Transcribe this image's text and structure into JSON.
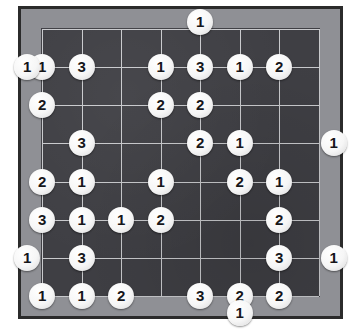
{
  "app": {
    "title": "Numbered Go Board Puzzle",
    "board_type": "go-board"
  },
  "colors": {
    "page_background": "#ffffff",
    "outer_border": "#2b2b2b",
    "frame": "#8f9095",
    "surface": "#3f3f44",
    "grid_line": "#c9cacd",
    "stone_fill": "#f6f6f6",
    "stone_text": "#16161a"
  },
  "board": {
    "columns": 8,
    "rows": 8,
    "grid": {
      "left": 20,
      "top": 19,
      "cell_width": 39.5,
      "cell_height": 38.2
    }
  },
  "stones": [
    {
      "label": "1",
      "col": 4,
      "row": -0.18,
      "placement": "top-edge",
      "name": "stone-top-c4"
    },
    {
      "label": "1",
      "col": -0.38,
      "row": 1,
      "placement": "left-edge",
      "name": "stone-r1-left"
    },
    {
      "label": "1",
      "col": 0,
      "row": 1,
      "placement": "on-board",
      "name": "stone-r1-c0"
    },
    {
      "label": "3",
      "col": 1,
      "row": 1,
      "placement": "on-board",
      "name": "stone-r1-c1"
    },
    {
      "label": "1",
      "col": 3,
      "row": 1,
      "placement": "on-board",
      "name": "stone-r1-c3"
    },
    {
      "label": "3",
      "col": 4,
      "row": 1,
      "placement": "on-board",
      "name": "stone-r1-c4"
    },
    {
      "label": "1",
      "col": 5,
      "row": 1,
      "placement": "on-board",
      "name": "stone-r1-c5"
    },
    {
      "label": "2",
      "col": 6,
      "row": 1,
      "placement": "on-board",
      "name": "stone-r1-c6"
    },
    {
      "label": "2",
      "col": 0,
      "row": 2,
      "placement": "on-board",
      "name": "stone-r2-c0"
    },
    {
      "label": "2",
      "col": 3,
      "row": 2,
      "placement": "on-board",
      "name": "stone-r2-c3"
    },
    {
      "label": "2",
      "col": 4,
      "row": 2,
      "placement": "on-board",
      "name": "stone-r2-c4"
    },
    {
      "label": "3",
      "col": 1,
      "row": 3,
      "placement": "on-board",
      "name": "stone-r3-c1"
    },
    {
      "label": "2",
      "col": 4,
      "row": 3,
      "placement": "on-board",
      "name": "stone-r3-c4"
    },
    {
      "label": "1",
      "col": 5,
      "row": 3,
      "placement": "on-board",
      "name": "stone-r3-c5"
    },
    {
      "label": "1",
      "col": 7.38,
      "row": 3,
      "placement": "right-edge",
      "name": "stone-r3-right"
    },
    {
      "label": "2",
      "col": 0,
      "row": 4,
      "placement": "on-board",
      "name": "stone-r4-c0"
    },
    {
      "label": "1",
      "col": 1,
      "row": 4,
      "placement": "on-board",
      "name": "stone-r4-c1"
    },
    {
      "label": "1",
      "col": 3,
      "row": 4,
      "placement": "on-board",
      "name": "stone-r4-c3"
    },
    {
      "label": "2",
      "col": 5,
      "row": 4,
      "placement": "on-board",
      "name": "stone-r4-c5"
    },
    {
      "label": "1",
      "col": 6,
      "row": 4,
      "placement": "on-board",
      "name": "stone-r4-c6"
    },
    {
      "label": "3",
      "col": 0,
      "row": 5,
      "placement": "on-board",
      "name": "stone-r5-c0"
    },
    {
      "label": "1",
      "col": 1,
      "row": 5,
      "placement": "on-board",
      "name": "stone-r5-c1"
    },
    {
      "label": "1",
      "col": 2,
      "row": 5,
      "placement": "on-board",
      "name": "stone-r5-c2"
    },
    {
      "label": "2",
      "col": 3,
      "row": 5,
      "placement": "on-board",
      "name": "stone-r5-c3"
    },
    {
      "label": "2",
      "col": 6,
      "row": 5,
      "placement": "on-board",
      "name": "stone-r5-c6"
    },
    {
      "label": "1",
      "col": -0.38,
      "row": 6,
      "placement": "left-edge",
      "name": "stone-r6-left"
    },
    {
      "label": "3",
      "col": 1,
      "row": 6,
      "placement": "on-board",
      "name": "stone-r6-c1"
    },
    {
      "label": "3",
      "col": 6,
      "row": 6,
      "placement": "on-board",
      "name": "stone-r6-c6"
    },
    {
      "label": "1",
      "col": 7.38,
      "row": 6,
      "placement": "right-edge",
      "name": "stone-r6-right"
    },
    {
      "label": "1",
      "col": 0,
      "row": 7,
      "placement": "on-board",
      "name": "stone-r7-c0"
    },
    {
      "label": "1",
      "col": 1,
      "row": 7,
      "placement": "on-board",
      "name": "stone-r7-c1"
    },
    {
      "label": "2",
      "col": 2,
      "row": 7,
      "placement": "on-board",
      "name": "stone-r7-c2"
    },
    {
      "label": "3",
      "col": 4,
      "row": 7,
      "placement": "on-board",
      "name": "stone-r7-c4"
    },
    {
      "label": "2",
      "col": 5,
      "row": 7,
      "placement": "on-board",
      "name": "stone-r7-c5"
    },
    {
      "label": "2",
      "col": 6,
      "row": 7,
      "placement": "on-board",
      "name": "stone-r7-c6"
    },
    {
      "label": "1",
      "col": 5,
      "row": 7.45,
      "placement": "bottom-edge",
      "name": "stone-bottom-c5"
    }
  ]
}
